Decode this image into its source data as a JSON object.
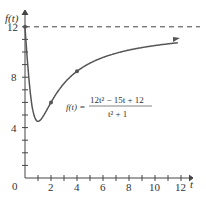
{
  "chart_data": {
    "type": "line",
    "title": "",
    "xlabel": "t",
    "ylabel": "f(t)",
    "formula": "f(t) = (12t^2 - 15t + 12)/(t^2 + 1)",
    "formula_label": "f(t) =",
    "formula_num": "12t² − 15t + 12",
    "formula_den": "t² + 1",
    "xlim": [
      0,
      12.5
    ],
    "ylim": [
      0,
      12.5
    ],
    "x_ticks": [
      "2",
      "4",
      "6",
      "8",
      "10",
      "12"
    ],
    "y_ticks": [
      "4",
      "8",
      "12"
    ],
    "origin_label": "0",
    "asymptote": 12,
    "x": [
      0,
      0.5,
      1,
      1.5,
      2,
      3,
      4,
      5,
      6,
      7,
      8,
      9,
      10,
      11,
      12
    ],
    "values": [
      12,
      7.2,
      4.5,
      4.38,
      6,
      7.8,
      8.47,
      9.12,
      9.57,
      9.96,
      10.34,
      10.53,
      10.7,
      10.81,
      10.9
    ],
    "marked_points": [
      [
        0,
        12
      ],
      [
        2,
        6
      ],
      [
        4,
        8.47
      ]
    ]
  }
}
